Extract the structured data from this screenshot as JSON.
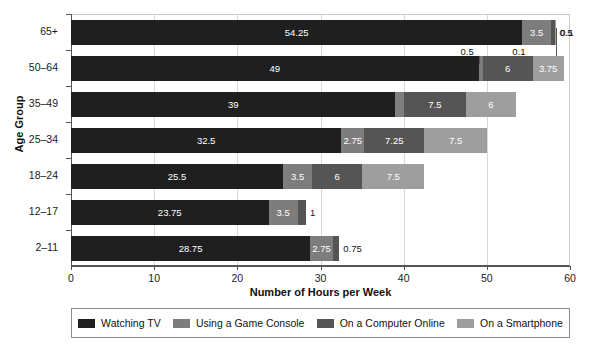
{
  "chart_data": {
    "type": "bar",
    "orientation": "horizontal",
    "stacked": true,
    "title": "",
    "xlabel": "Number of Hours per Week",
    "ylabel": "Age Group",
    "xlim": [
      0,
      60
    ],
    "xticks": [
      0,
      10,
      20,
      30,
      40,
      50,
      60
    ],
    "xtick_labels": [
      "0",
      "10",
      "20",
      "30",
      "40",
      "50",
      "60"
    ],
    "grid": true,
    "grid_axis": "x",
    "legend_position": "bottom",
    "categories": [
      "2–11",
      "12–17",
      "18–24",
      "25–34",
      "35–49",
      "50–64",
      "65+"
    ],
    "series": [
      {
        "name": "Watching TV",
        "color": "#1f1f1f",
        "values": [
          28.75,
          23.75,
          25.5,
          32.5,
          39,
          49,
          54.25
        ]
      },
      {
        "name": "Using a Game Console",
        "color": "#7d7d7d",
        "values": [
          2.75,
          3.5,
          3.5,
          2.75,
          1,
          0.5,
          3.5
        ]
      },
      {
        "name": "On a Computer Online",
        "color": "#555555",
        "values": [
          0.75,
          1,
          6,
          7.25,
          7.5,
          6,
          0.5
        ]
      },
      {
        "name": "On a Smartphone",
        "color": "#9e9e9e",
        "values": [
          0,
          0,
          7.5,
          7.5,
          6,
          3.75,
          0.1
        ]
      }
    ],
    "bar_labels": {
      "2–11": [
        "28.75",
        "2.75",
        "0.75",
        ""
      ],
      "12–17": [
        "23.75",
        "3.5",
        "1",
        ""
      ],
      "18–24": [
        "25.5",
        "3.5",
        "6",
        "7.5"
      ],
      "25–34": [
        "32.5",
        "2.75",
        "7.25",
        "7.5"
      ],
      "35–49": [
        "39",
        "1",
        "7.5",
        "6"
      ],
      "50–64": [
        "49",
        "0.5",
        "6",
        "3.75"
      ],
      "65+": [
        "54.25",
        "3.5",
        "0.5",
        "0.1"
      ]
    },
    "callouts": [
      {
        "text": "0.5",
        "series": "Using a Game Console",
        "category": "50–64"
      },
      {
        "text": "0.1",
        "series": "On a Smartphone",
        "category": "65+"
      }
    ]
  },
  "legend": {
    "items": [
      {
        "label": "Watching TV",
        "color": "#1f1f1f"
      },
      {
        "label": "Using a Game Console",
        "color": "#7d7d7d"
      },
      {
        "label": "On a Computer Online",
        "color": "#555555"
      },
      {
        "label": "On a Smartphone",
        "color": "#9e9e9e"
      }
    ]
  }
}
